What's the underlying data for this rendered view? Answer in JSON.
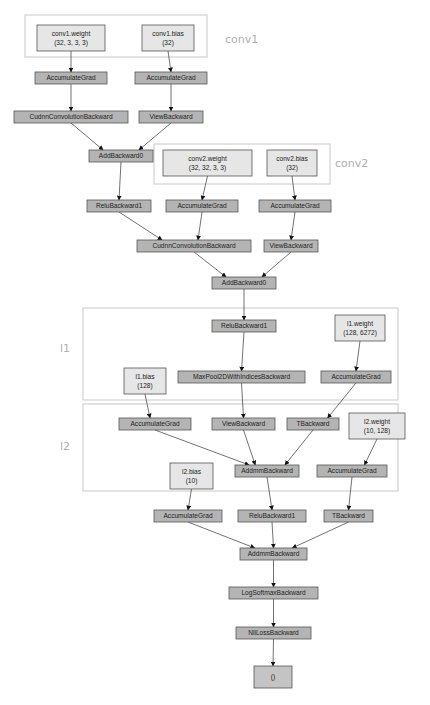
{
  "diagram": {
    "type": "pytorch-autograd-graph",
    "clusters": [
      {
        "id": "conv1",
        "label": "conv1"
      },
      {
        "id": "conv2",
        "label": "conv2"
      },
      {
        "id": "l1",
        "label": "l1"
      },
      {
        "id": "l2",
        "label": "l2"
      }
    ],
    "nodes": [
      {
        "id": "conv1_weight",
        "kind": "param",
        "lines": [
          "conv1.weight",
          "(32, 3, 3, 3)"
        ],
        "cluster": "conv1"
      },
      {
        "id": "conv1_bias",
        "kind": "param",
        "lines": [
          "conv1.bias",
          "(32)"
        ],
        "cluster": "conv1"
      },
      {
        "id": "acc1",
        "kind": "op",
        "lines": [
          "AccumulateGrad"
        ]
      },
      {
        "id": "acc2",
        "kind": "op",
        "lines": [
          "AccumulateGrad"
        ]
      },
      {
        "id": "cudnn1",
        "kind": "op",
        "lines": [
          "CudnnConvolutionBackward"
        ]
      },
      {
        "id": "view1",
        "kind": "op",
        "lines": [
          "ViewBackward"
        ]
      },
      {
        "id": "add1",
        "kind": "op",
        "lines": [
          "AddBackward0"
        ]
      },
      {
        "id": "conv2_weight",
        "kind": "param",
        "lines": [
          "conv2.weight",
          "(32, 32, 3, 3)"
        ],
        "cluster": "conv2"
      },
      {
        "id": "conv2_bias",
        "kind": "param",
        "lines": [
          "conv2.bias",
          "(32)"
        ],
        "cluster": "conv2"
      },
      {
        "id": "relu1",
        "kind": "op",
        "lines": [
          "ReluBackward1"
        ]
      },
      {
        "id": "acc3",
        "kind": "op",
        "lines": [
          "AccumulateGrad"
        ]
      },
      {
        "id": "acc4",
        "kind": "op",
        "lines": [
          "AccumulateGrad"
        ]
      },
      {
        "id": "cudnn2",
        "kind": "op",
        "lines": [
          "CudnnConvolutionBackward"
        ]
      },
      {
        "id": "view2",
        "kind": "op",
        "lines": [
          "ViewBackward"
        ]
      },
      {
        "id": "add2",
        "kind": "op",
        "lines": [
          "AddBackward0"
        ]
      },
      {
        "id": "relu2",
        "kind": "op",
        "lines": [
          "ReluBackward1"
        ]
      },
      {
        "id": "l1_weight",
        "kind": "param",
        "lines": [
          "l1.weight",
          "(128, 6272)"
        ],
        "cluster": "l1"
      },
      {
        "id": "l1_bias",
        "kind": "param",
        "lines": [
          "l1.bias",
          "(128)"
        ],
        "cluster": "l1"
      },
      {
        "id": "maxpool",
        "kind": "op",
        "lines": [
          "MaxPool2DWithIndicesBackward"
        ]
      },
      {
        "id": "acc5",
        "kind": "op",
        "lines": [
          "AccumulateGrad"
        ]
      },
      {
        "id": "acc6",
        "kind": "op",
        "lines": [
          "AccumulateGrad"
        ]
      },
      {
        "id": "view3",
        "kind": "op",
        "lines": [
          "ViewBackward"
        ]
      },
      {
        "id": "t1",
        "kind": "op",
        "lines": [
          "TBackward"
        ]
      },
      {
        "id": "l2_weight",
        "kind": "param",
        "lines": [
          "l2.weight",
          "(10, 128)"
        ],
        "cluster": "l2"
      },
      {
        "id": "addmm1",
        "kind": "op",
        "lines": [
          "AddmmBackward"
        ]
      },
      {
        "id": "acc7",
        "kind": "op",
        "lines": [
          "AccumulateGrad"
        ]
      },
      {
        "id": "l2_bias",
        "kind": "param",
        "lines": [
          "l2.bias",
          "(10)"
        ],
        "cluster": "l2"
      },
      {
        "id": "acc8",
        "kind": "op",
        "lines": [
          "AccumulateGrad"
        ]
      },
      {
        "id": "relu3",
        "kind": "op",
        "lines": [
          "ReluBackward1"
        ]
      },
      {
        "id": "t2",
        "kind": "op",
        "lines": [
          "TBackward"
        ]
      },
      {
        "id": "addmm2",
        "kind": "op",
        "lines": [
          "AddmmBackward"
        ]
      },
      {
        "id": "logsoftmax",
        "kind": "op",
        "lines": [
          "LogSoftmaxBackward"
        ]
      },
      {
        "id": "nllloss",
        "kind": "op",
        "lines": [
          "NllLossBackward"
        ]
      },
      {
        "id": "output",
        "kind": "out",
        "lines": [
          "()"
        ]
      }
    ],
    "edges": [
      [
        "conv1_weight",
        "acc1"
      ],
      [
        "conv1_bias",
        "acc2"
      ],
      [
        "acc1",
        "cudnn1"
      ],
      [
        "acc2",
        "view1"
      ],
      [
        "cudnn1",
        "add1"
      ],
      [
        "view1",
        "add1"
      ],
      [
        "add1",
        "relu1"
      ],
      [
        "conv2_weight",
        "acc3"
      ],
      [
        "conv2_bias",
        "acc4"
      ],
      [
        "relu1",
        "cudnn2"
      ],
      [
        "acc3",
        "cudnn2"
      ],
      [
        "acc4",
        "view2"
      ],
      [
        "cudnn2",
        "add2"
      ],
      [
        "view2",
        "add2"
      ],
      [
        "add2",
        "relu2"
      ],
      [
        "l1_weight",
        "acc5"
      ],
      [
        "relu2",
        "maxpool"
      ],
      [
        "l1_bias",
        "acc6"
      ],
      [
        "maxpool",
        "view3"
      ],
      [
        "acc5",
        "t1"
      ],
      [
        "acc6",
        "addmm1"
      ],
      [
        "view3",
        "addmm1"
      ],
      [
        "t1",
        "addmm1"
      ],
      [
        "l2_weight",
        "acc7"
      ],
      [
        "l2_bias",
        "acc8"
      ],
      [
        "addmm1",
        "relu3"
      ],
      [
        "acc7",
        "t2"
      ],
      [
        "acc8",
        "addmm2"
      ],
      [
        "relu3",
        "addmm2"
      ],
      [
        "t2",
        "addmm2"
      ],
      [
        "addmm2",
        "logsoftmax"
      ],
      [
        "logsoftmax",
        "nllloss"
      ],
      [
        "nllloss",
        "output"
      ]
    ]
  }
}
